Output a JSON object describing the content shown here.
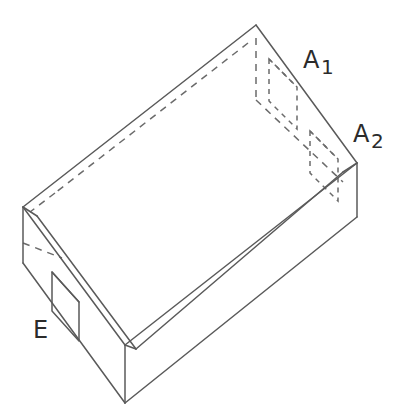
{
  "figure": {
    "type": "technical-line-drawing",
    "background_color": "#ffffff",
    "solid_line_color": "#5a5a5a",
    "hidden_line_color": "#6b6b6b",
    "label_color": "#2b2b2b",
    "line_width": 1.5,
    "hidden_line_style": "dashed"
  },
  "labels": {
    "a1": {
      "base": "A",
      "subscript": "1"
    },
    "a2": {
      "base": "A",
      "subscript": "2"
    },
    "e": {
      "base": "E"
    }
  },
  "features": [
    {
      "id": "a1",
      "label": "A1",
      "kind": "hidden-slot",
      "location": "back-right wall, upper",
      "visibility": "hidden"
    },
    {
      "id": "a2",
      "label": "A2",
      "kind": "hidden-slot",
      "location": "back-right wall, lower near right corner",
      "visibility": "hidden"
    },
    {
      "id": "e",
      "label": "E",
      "kind": "visible-notch",
      "location": "left front wall",
      "visibility": "visible"
    }
  ],
  "geometry": {
    "outer_top_back": [
      256,
      25
    ],
    "outer_top_left": [
      23,
      207
    ],
    "outer_top_right": [
      357,
      163
    ],
    "outer_top_front": [
      125,
      345
    ],
    "outer_bottom_left": [
      23,
      263
    ],
    "outer_bottom_right": [
      357,
      217
    ],
    "outer_bottom_front": [
      125,
      403
    ],
    "rim_thickness_px": 12
  }
}
